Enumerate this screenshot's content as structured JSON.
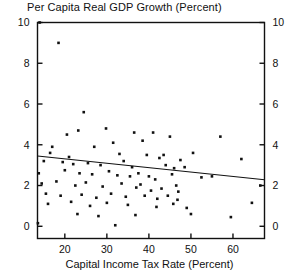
{
  "chart_data": {
    "type": "scatter",
    "title": "Per Capita Real GDP Growth (Percent)",
    "xlabel": "Capital Income Tax Rate (Percent)",
    "ylabel": "",
    "xlim": [
      13.5,
      67.5
    ],
    "ylim": [
      -0.6,
      10.0
    ],
    "grid": false,
    "legend": null,
    "y_axis_left_ticks": [
      "0",
      "2",
      "4",
      "6",
      "8",
      "10"
    ],
    "y_axis_right_ticks": [
      "0",
      "2",
      "4",
      "6",
      "8",
      "10"
    ],
    "x_axis_ticks": [
      "20",
      "30",
      "40",
      "50",
      "60"
    ],
    "y_tick_values": [
      0,
      2,
      4,
      6,
      8,
      10
    ],
    "x_tick_values": [
      20,
      30,
      40,
      50,
      60
    ],
    "trendline": {
      "name": "fitted-regression-line",
      "x_start": 13.5,
      "y_start": 3.45,
      "x_end": 67.5,
      "y_end": 2.28
    },
    "points": [
      [
        18.5,
        9.0
      ],
      [
        14.0,
        10.0
      ],
      [
        24.5,
        5.6
      ],
      [
        23.2,
        4.7
      ],
      [
        29.8,
        4.8
      ],
      [
        36.5,
        4.6
      ],
      [
        20.5,
        4.5
      ],
      [
        41.0,
        4.6
      ],
      [
        45.0,
        4.4
      ],
      [
        57.0,
        4.4
      ],
      [
        17.0,
        3.9
      ],
      [
        27.0,
        3.9
      ],
      [
        31.5,
        4.1
      ],
      [
        38.5,
        4.2
      ],
      [
        43.5,
        3.5
      ],
      [
        50.5,
        3.6
      ],
      [
        16.5,
        3.6
      ],
      [
        21.0,
        3.4
      ],
      [
        33.0,
        3.55
      ],
      [
        39.5,
        3.5
      ],
      [
        42.5,
        3.35
      ],
      [
        47.5,
        3.25
      ],
      [
        62.0,
        3.3
      ],
      [
        15.0,
        3.2
      ],
      [
        19.5,
        3.15
      ],
      [
        22.0,
        3.05
      ],
      [
        25.5,
        3.1
      ],
      [
        28.5,
        3.0
      ],
      [
        34.0,
        3.2
      ],
      [
        36.0,
        2.9
      ],
      [
        44.0,
        3.0
      ],
      [
        46.0,
        2.85
      ],
      [
        48.5,
        2.9
      ],
      [
        13.8,
        2.6
      ],
      [
        20.0,
        2.75
      ],
      [
        23.5,
        2.6
      ],
      [
        26.5,
        2.55
      ],
      [
        30.5,
        2.7
      ],
      [
        32.5,
        2.5
      ],
      [
        35.5,
        2.45
      ],
      [
        37.5,
        2.6
      ],
      [
        40.0,
        2.45
      ],
      [
        41.5,
        2.3
      ],
      [
        45.5,
        2.55
      ],
      [
        52.5,
        2.4
      ],
      [
        55.0,
        2.45
      ],
      [
        14.5,
        2.1
      ],
      [
        18.0,
        2.2
      ],
      [
        22.5,
        2.0
      ],
      [
        25.0,
        2.15
      ],
      [
        29.0,
        1.95
      ],
      [
        33.5,
        2.1
      ],
      [
        37.0,
        1.9
      ],
      [
        38.0,
        2.05
      ],
      [
        40.5,
        1.75
      ],
      [
        43.0,
        1.85
      ],
      [
        46.5,
        2.0
      ],
      [
        47.0,
        1.7
      ],
      [
        15.5,
        1.6
      ],
      [
        19.0,
        1.5
      ],
      [
        24.0,
        1.55
      ],
      [
        27.5,
        1.4
      ],
      [
        31.0,
        1.6
      ],
      [
        34.5,
        1.45
      ],
      [
        39.0,
        1.5
      ],
      [
        42.0,
        1.35
      ],
      [
        44.5,
        1.5
      ],
      [
        46.8,
        1.3
      ],
      [
        16.0,
        1.1
      ],
      [
        21.5,
        1.2
      ],
      [
        26.0,
        1.0
      ],
      [
        30.0,
        1.15
      ],
      [
        35.0,
        1.05
      ],
      [
        41.8,
        0.95
      ],
      [
        45.8,
        1.1
      ],
      [
        49.0,
        0.9
      ],
      [
        13.6,
        0.15
      ],
      [
        23.0,
        0.6
      ],
      [
        28.0,
        0.5
      ],
      [
        36.8,
        0.55
      ],
      [
        32.0,
        0.05
      ],
      [
        50.0,
        0.6
      ],
      [
        59.5,
        0.45
      ],
      [
        64.5,
        1.15
      ],
      [
        66.5,
        2.0
      ]
    ]
  }
}
